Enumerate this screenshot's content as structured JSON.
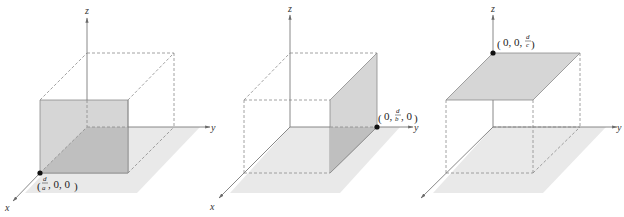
{
  "colors": {
    "floor": "#e9e9e9",
    "plane": "#d6d6d6",
    "plane_overlap": "#bfbfbf",
    "axis": "#7a7a7a",
    "dash": "#8a8a8a",
    "point": "#111111"
  },
  "panels": [
    {
      "name": "x-intercept plane",
      "axes": {
        "x": "x",
        "y": "y",
        "z": "z"
      },
      "point_label": {
        "open": "(",
        "num": "d",
        "den": "a",
        "rest": ", 0, 0)"
      }
    },
    {
      "name": "y-intercept plane",
      "axes": {
        "x": "x",
        "y": "y",
        "z": "z"
      },
      "point_label": {
        "open": "(0, ",
        "num": "d",
        "den": "b",
        "rest": ", 0)"
      }
    },
    {
      "name": "z-intercept plane",
      "axes": {
        "x": "x",
        "y": "y",
        "z": "z"
      },
      "point_label": {
        "open": "(0, 0, ",
        "num": "d",
        "den": "c",
        "rest": ")"
      }
    }
  ]
}
